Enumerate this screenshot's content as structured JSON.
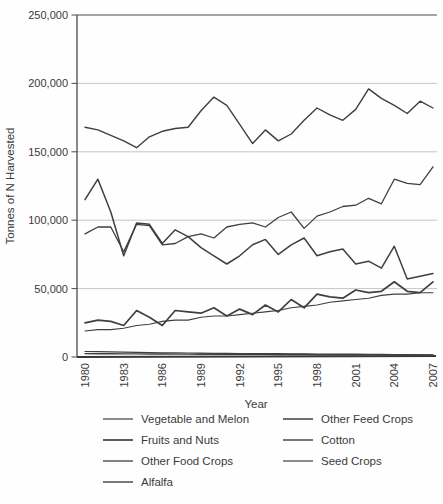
{
  "figure": {
    "title": "",
    "background": "#fefefe"
  },
  "chart_data": {
    "type": "line",
    "xlabel": "Year",
    "ylabel": "Tonnes of N Harvested",
    "x": [
      1980,
      1981,
      1982,
      1983,
      1984,
      1985,
      1986,
      1987,
      1988,
      1989,
      1990,
      1991,
      1992,
      1993,
      1994,
      1995,
      1996,
      1997,
      1998,
      1999,
      2000,
      2001,
      2002,
      2003,
      2004,
      2005,
      2006,
      2007
    ],
    "x_tick_labels": [
      "1980",
      "1983",
      "1986",
      "1989",
      "1992",
      "1995",
      "1998",
      "2001",
      "2004",
      "2007"
    ],
    "ylim": [
      0,
      250000
    ],
    "yticks": [
      0,
      50000,
      100000,
      150000,
      200000,
      250000
    ],
    "ytick_labels": [
      "0",
      "50,000",
      "100,000",
      "150,000",
      "200,000",
      "250,000"
    ],
    "grid": "horizontal",
    "legend_position": "below-two-columns",
    "line_color": "#3f3f3f",
    "grid_color": "#c6c6c6",
    "axis_color": "#4a4a4a",
    "series": [
      {
        "name": "Vegetable and Melon",
        "stroke_width": 1.1,
        "values": [
          19000,
          20000,
          20000,
          21000,
          23000,
          24000,
          26000,
          27000,
          27000,
          29000,
          30000,
          30000,
          31000,
          32000,
          33000,
          34000,
          36000,
          37000,
          38000,
          40000,
          41000,
          42000,
          43000,
          45000,
          46000,
          46000,
          47000,
          47000
        ]
      },
      {
        "name": "Fruits and Nuts",
        "stroke_width": 1.7,
        "values": [
          25000,
          27000,
          26000,
          23000,
          34000,
          29000,
          23000,
          34000,
          33000,
          32000,
          36000,
          30000,
          35000,
          31000,
          38000,
          33000,
          42000,
          36000,
          46000,
          44000,
          43000,
          49000,
          47000,
          48000,
          55000,
          48000,
          47000,
          55000
        ]
      },
      {
        "name": "Other Food Crops",
        "stroke_width": 1.3,
        "values": [
          90000,
          95000,
          95000,
          77000,
          97000,
          96000,
          82000,
          83000,
          88000,
          90000,
          87000,
          95000,
          97000,
          98000,
          95000,
          102000,
          106000,
          94000,
          103000,
          106000,
          110000,
          111000,
          116000,
          112000,
          130000,
          127000,
          126000,
          139000
        ]
      },
      {
        "name": "Alfalfa",
        "stroke_width": 1.4,
        "values": [
          168000,
          166000,
          162000,
          158000,
          153000,
          161000,
          165000,
          167000,
          168000,
          180000,
          190000,
          184000,
          170000,
          156000,
          166000,
          158000,
          163000,
          173000,
          182000,
          177000,
          173000,
          181000,
          196000,
          189000,
          184000,
          178000,
          187000,
          182000
        ]
      },
      {
        "name": "Other Feed Crops",
        "stroke_width": 1.5,
        "values": [
          115000,
          130000,
          106000,
          74000,
          98000,
          97000,
          83000,
          93000,
          88000,
          80000,
          74000,
          68000,
          74000,
          82000,
          86000,
          75000,
          82000,
          87000,
          74000,
          77000,
          79000,
          68000,
          70000,
          65000,
          81000,
          57000,
          59000,
          61000
        ]
      },
      {
        "name": "Cotton",
        "stroke_width": 1.4,
        "values": [
          2500,
          2400,
          2400,
          2300,
          2300,
          2200,
          2200,
          2100,
          2100,
          2000,
          2000,
          2000,
          1900,
          1900,
          1900,
          1800,
          1800,
          1800,
          1700,
          1700,
          1700,
          1600,
          1600,
          1600,
          1500,
          1500,
          1500,
          1400
        ]
      },
      {
        "name": "Seed Crops",
        "stroke_width": 1.2,
        "values": [
          4000,
          3900,
          3700,
          3600,
          3400,
          3300,
          3100,
          3000,
          2900,
          2800,
          2700,
          2600,
          2500,
          2500,
          2400,
          2400,
          2300,
          2300,
          2200,
          2200,
          2100,
          2100,
          2000,
          1900,
          1800,
          1700,
          1600,
          1500
        ]
      }
    ],
    "legend_columns": [
      [
        "Vegetable and Melon",
        "Fruits and Nuts",
        "Other Food Crops",
        "Alfalfa"
      ],
      [
        "Other Feed Crops",
        "Cotton",
        "Seed Crops"
      ]
    ]
  }
}
